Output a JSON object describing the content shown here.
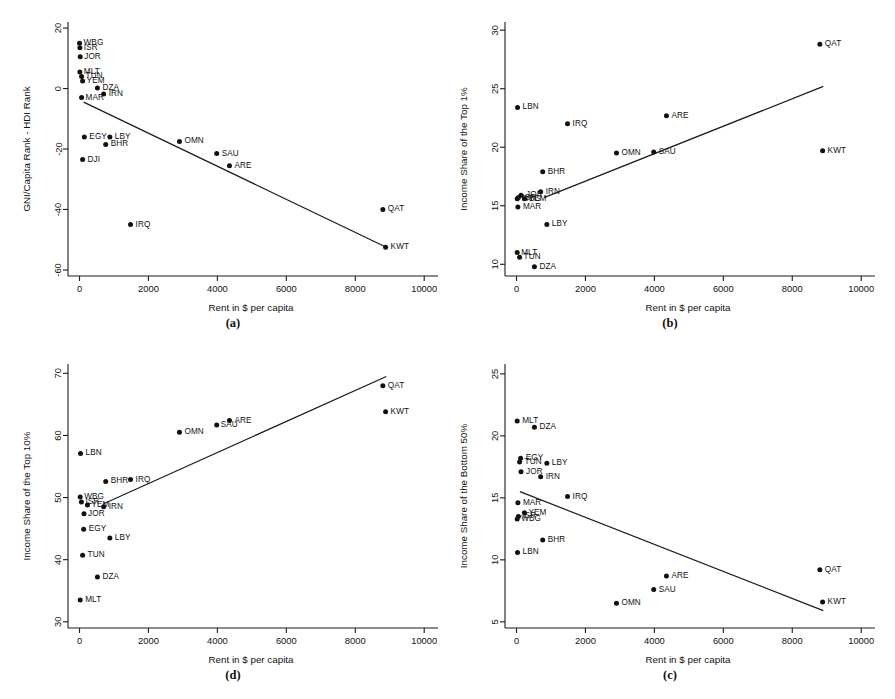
{
  "figure": {
    "width": 895,
    "height": 699,
    "background": "#ffffff",
    "ink": "#111111",
    "shared_xlabel": "Rent in $ per capita",
    "shared_xlim": [
      -450,
      10400
    ],
    "shared_xticks": [
      0,
      2000,
      4000,
      6000,
      8000,
      10000
    ]
  },
  "panels": [
    {
      "key": "a",
      "caption": "(a)",
      "chart_data": {
        "type": "scatter",
        "title": "",
        "xlabel": "Rent in $ per capita",
        "ylabel": "GNI/Capita Rank - HDI Rank",
        "xlim": [
          -450,
          10400
        ],
        "ylim": [
          -62,
          22
        ],
        "xticks": [
          0,
          2000,
          4000,
          6000,
          8000,
          10000
        ],
        "yticks": [
          20,
          0,
          -20,
          -40,
          -60
        ],
        "grid": false,
        "legend": "none",
        "points": [
          {
            "label": "WBG",
            "x": 0,
            "y": 15,
            "lx": 4,
            "ly": -1
          },
          {
            "label": "ISR",
            "x": 10,
            "y": 13.5,
            "lx": 4,
            "ly": -1
          },
          {
            "label": "JOR",
            "x": 20,
            "y": 10.5,
            "lx": 4,
            "ly": -1
          },
          {
            "label": "MLT",
            "x": 10,
            "y": 5.5,
            "lx": 4,
            "ly": -1
          },
          {
            "label": "TUN",
            "x": 60,
            "y": 4.0,
            "lx": 4,
            "ly": -1
          },
          {
            "label": "YEM",
            "x": 90,
            "y": 2.5,
            "lx": 4,
            "ly": -1
          },
          {
            "label": "DZA",
            "x": 520,
            "y": 0.2,
            "lx": 5,
            "ly": -1
          },
          {
            "label": "IRN",
            "x": 700,
            "y": -1.8,
            "lx": 5,
            "ly": -1
          },
          {
            "label": "MAR",
            "x": 60,
            "y": -3.0,
            "lx": 4,
            "ly": -1
          },
          {
            "label": "EGY",
            "x": 140,
            "y": -16.0,
            "lx": 5,
            "ly": -1
          },
          {
            "label": "LBY",
            "x": 880,
            "y": -16.0,
            "lx": 5,
            "ly": -1
          },
          {
            "label": "BHR",
            "x": 760,
            "y": -18.5,
            "lx": 5,
            "ly": -1
          },
          {
            "label": "DJI",
            "x": 90,
            "y": -23.5,
            "lx": 5,
            "ly": -1
          },
          {
            "label": "OMN",
            "x": 2900,
            "y": -17.5,
            "lx": 5,
            "ly": -1
          },
          {
            "label": "SAU",
            "x": 3980,
            "y": -21.5,
            "lx": 5,
            "ly": -1
          },
          {
            "label": "ARE",
            "x": 4350,
            "y": -25.5,
            "lx": 5,
            "ly": -1
          },
          {
            "label": "QAT",
            "x": 8800,
            "y": -40.0,
            "lx": 5,
            "ly": -1
          },
          {
            "label": "KWT",
            "x": 8880,
            "y": -52.5,
            "lx": 5,
            "ly": -1
          },
          {
            "label": "IRQ",
            "x": 1480,
            "y": -45.0,
            "lx": 5,
            "ly": -1
          }
        ],
        "fit_line": {
          "x1": 120,
          "y1": -4.5,
          "x2": 8900,
          "y2": -52.5
        }
      }
    },
    {
      "key": "b",
      "caption": "(b)",
      "chart_data": {
        "type": "scatter",
        "title": "",
        "xlabel": "Rent in $ per capita",
        "ylabel": "Income Share of the Top 1%",
        "xlim": [
          -450,
          10400
        ],
        "ylim": [
          9.0,
          30.7
        ],
        "xticks": [
          0,
          2000,
          4000,
          6000,
          8000,
          10000
        ],
        "yticks": [
          10,
          15,
          20,
          25,
          30
        ],
        "grid": false,
        "legend": "none",
        "points": [
          {
            "label": "QAT",
            "x": 8800,
            "y": 28.8,
            "lx": 5,
            "ly": -1
          },
          {
            "label": "LBN",
            "x": 30,
            "y": 23.4,
            "lx": 5,
            "ly": -1
          },
          {
            "label": "ARE",
            "x": 4350,
            "y": 22.7,
            "lx": 5,
            "ly": -1
          },
          {
            "label": "IRQ",
            "x": 1480,
            "y": 22.0,
            "lx": 5,
            "ly": -1
          },
          {
            "label": "KWT",
            "x": 8880,
            "y": 19.7,
            "lx": 5,
            "ly": -1
          },
          {
            "label": "SAU",
            "x": 3980,
            "y": 19.6,
            "lx": 5,
            "ly": -1
          },
          {
            "label": "OMN",
            "x": 2900,
            "y": 19.5,
            "lx": 5,
            "ly": -1
          },
          {
            "label": "BHR",
            "x": 760,
            "y": 17.9,
            "lx": 5,
            "ly": -1
          },
          {
            "label": "IRN",
            "x": 700,
            "y": 16.2,
            "lx": 5,
            "ly": -1
          },
          {
            "label": "JOR",
            "x": 130,
            "y": 15.9,
            "lx": 5,
            "ly": -1
          },
          {
            "label": "ISR",
            "x": 55,
            "y": 15.7,
            "lx": 4,
            "ly": -1
          },
          {
            "label": "WBG",
            "x": 20,
            "y": 15.6,
            "lx": 4,
            "ly": -1
          },
          {
            "label": "YEM",
            "x": 230,
            "y": 15.6,
            "lx": 4,
            "ly": -1
          },
          {
            "label": "MAR",
            "x": 40,
            "y": 14.9,
            "lx": 5,
            "ly": -1
          },
          {
            "label": "LBY",
            "x": 880,
            "y": 13.4,
            "lx": 5,
            "ly": -1
          },
          {
            "label": "MLT",
            "x": 20,
            "y": 11.0,
            "lx": 4,
            "ly": -1
          },
          {
            "label": "TUN",
            "x": 90,
            "y": 10.6,
            "lx": 4,
            "ly": -1
          },
          {
            "label": "DZA",
            "x": 520,
            "y": 9.8,
            "lx": 5,
            "ly": -1
          }
        ],
        "fit_line": {
          "x1": 800,
          "y1": 15.7,
          "x2": 8900,
          "y2": 25.2
        }
      }
    },
    {
      "key": "d",
      "caption": "(d)",
      "chart_data": {
        "type": "scatter",
        "title": "",
        "xlabel": "Rent in $ per capita",
        "ylabel": "Income Share of the Top 10%",
        "xlim": [
          -450,
          10400
        ],
        "ylim": [
          29.0,
          71.5
        ],
        "xticks": [
          0,
          2000,
          4000,
          6000,
          8000,
          10000
        ],
        "yticks": [
          30,
          40,
          50,
          60,
          70
        ],
        "grid": false,
        "legend": "none",
        "points": [
          {
            "label": "QAT",
            "x": 8800,
            "y": 68.0,
            "lx": 5,
            "ly": -1
          },
          {
            "label": "KWT",
            "x": 8880,
            "y": 63.8,
            "lx": 5,
            "ly": -1
          },
          {
            "label": "ARE",
            "x": 4350,
            "y": 62.4,
            "lx": 5,
            "ly": -1
          },
          {
            "label": "SAU",
            "x": 3980,
            "y": 61.7,
            "lx": 4,
            "ly": -1
          },
          {
            "label": "OMN",
            "x": 2900,
            "y": 60.5,
            "lx": 5,
            "ly": -1
          },
          {
            "label": "LBN",
            "x": 30,
            "y": 57.1,
            "lx": 5,
            "ly": -1
          },
          {
            "label": "BHR",
            "x": 760,
            "y": 52.6,
            "lx": 5,
            "ly": -1
          },
          {
            "label": "IRQ",
            "x": 1480,
            "y": 52.9,
            "lx": 5,
            "ly": -1
          },
          {
            "label": "WBG",
            "x": 20,
            "y": 50.1,
            "lx": 4,
            "ly": -1
          },
          {
            "label": "ISR",
            "x": 55,
            "y": 49.3,
            "lx": 4,
            "ly": -1
          },
          {
            "label": "YEM",
            "x": 230,
            "y": 48.8,
            "lx": 4,
            "ly": -1
          },
          {
            "label": "IRN",
            "x": 700,
            "y": 48.5,
            "lx": 5,
            "ly": -1
          },
          {
            "label": "JOR",
            "x": 130,
            "y": 47.4,
            "lx": 4,
            "ly": -1
          },
          {
            "label": "EGY",
            "x": 120,
            "y": 44.9,
            "lx": 5,
            "ly": -1
          },
          {
            "label": "LBY",
            "x": 880,
            "y": 43.5,
            "lx": 5,
            "ly": -1
          },
          {
            "label": "TUN",
            "x": 90,
            "y": 40.7,
            "lx": 5,
            "ly": -1
          },
          {
            "label": "DZA",
            "x": 520,
            "y": 37.2,
            "lx": 5,
            "ly": -1
          },
          {
            "label": "MLT",
            "x": 20,
            "y": 33.5,
            "lx": 5,
            "ly": -1
          }
        ],
        "fit_line": {
          "x1": 700,
          "y1": 49.0,
          "x2": 8900,
          "y2": 69.5
        }
      }
    },
    {
      "key": "c",
      "caption": "(c)",
      "chart_data": {
        "type": "scatter",
        "title": "",
        "xlabel": "Rent in $ per capita",
        "ylabel": "Income Share of the Bottom 50%",
        "xlim": [
          -450,
          10400
        ],
        "ylim": [
          4.5,
          25.8
        ],
        "xticks": [
          0,
          2000,
          4000,
          6000,
          8000,
          10000
        ],
        "yticks": [
          5,
          10,
          15,
          20,
          25
        ],
        "grid": false,
        "legend": "none",
        "points": [
          {
            "label": "MLT",
            "x": 20,
            "y": 21.2,
            "lx": 5,
            "ly": -1
          },
          {
            "label": "DZA",
            "x": 520,
            "y": 20.7,
            "lx": 5,
            "ly": -1
          },
          {
            "label": "EGY",
            "x": 120,
            "y": 18.2,
            "lx": 5,
            "ly": -1
          },
          {
            "label": "TUN",
            "x": 90,
            "y": 17.9,
            "lx": 5,
            "ly": -1
          },
          {
            "label": "LBY",
            "x": 880,
            "y": 17.8,
            "lx": 5,
            "ly": -1
          },
          {
            "label": "JOR",
            "x": 130,
            "y": 17.1,
            "lx": 5,
            "ly": -1
          },
          {
            "label": "IRN",
            "x": 700,
            "y": 16.7,
            "lx": 5,
            "ly": -1
          },
          {
            "label": "IRQ",
            "x": 1480,
            "y": 15.1,
            "lx": 5,
            "ly": -1
          },
          {
            "label": "MAR",
            "x": 40,
            "y": 14.6,
            "lx": 5,
            "ly": -1
          },
          {
            "label": "YEM",
            "x": 230,
            "y": 13.8,
            "lx": 4,
            "ly": -1
          },
          {
            "label": "ISR",
            "x": 55,
            "y": 13.5,
            "lx": 4,
            "ly": -1
          },
          {
            "label": "WBG",
            "x": 20,
            "y": 13.3,
            "lx": 4,
            "ly": -1
          },
          {
            "label": "BHR",
            "x": 760,
            "y": 11.6,
            "lx": 5,
            "ly": -1
          },
          {
            "label": "LBN",
            "x": 30,
            "y": 10.6,
            "lx": 5,
            "ly": -1
          },
          {
            "label": "QAT",
            "x": 8800,
            "y": 9.2,
            "lx": 5,
            "ly": -1
          },
          {
            "label": "ARE",
            "x": 4350,
            "y": 8.7,
            "lx": 5,
            "ly": -1
          },
          {
            "label": "SAU",
            "x": 3980,
            "y": 7.6,
            "lx": 5,
            "ly": -1
          },
          {
            "label": "OMN",
            "x": 2900,
            "y": 6.5,
            "lx": 5,
            "ly": -1
          },
          {
            "label": "KWT",
            "x": 8880,
            "y": 6.6,
            "lx": 5,
            "ly": -1
          }
        ],
        "fit_line": {
          "x1": 100,
          "y1": 15.5,
          "x2": 8900,
          "y2": 5.9
        }
      }
    }
  ],
  "layout": {
    "panel_boxes": [
      {
        "key": "a",
        "left": 18,
        "top": 8,
        "width": 430,
        "height": 330
      },
      {
        "key": "b",
        "left": 455,
        "top": 8,
        "width": 430,
        "height": 330
      },
      {
        "key": "d",
        "left": 18,
        "top": 350,
        "width": 430,
        "height": 340
      },
      {
        "key": "c",
        "left": 455,
        "top": 350,
        "width": 430,
        "height": 340
      }
    ]
  }
}
